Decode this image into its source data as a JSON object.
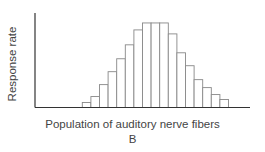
{
  "chart_data": {
    "type": "bar",
    "title": "",
    "xlabel": "Population of auditory nerve fibers",
    "ylabel": "Response rate",
    "panel_label": "B",
    "categories": [
      "1",
      "2",
      "3",
      "4",
      "5",
      "6",
      "7",
      "8",
      "9",
      "10",
      "11",
      "12",
      "13",
      "14",
      "15",
      "16",
      "17"
    ],
    "values": [
      5,
      11,
      23,
      36,
      49,
      63,
      78,
      85,
      85,
      85,
      74,
      55,
      42,
      28,
      20,
      13,
      8
    ],
    "ylim": [
      0,
      95
    ],
    "grid": false,
    "legend": null,
    "tick_labels": false,
    "bar_fill": "#ffffff",
    "bar_stroke": "#888888",
    "axis_color": "#333333"
  }
}
